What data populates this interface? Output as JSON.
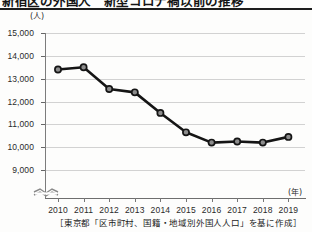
{
  "title": "新宿区の外国人　新型コロナ禍以前の推移",
  "caption": "［東京都「区市町村、国籍・地域別外国人人口」を基に作成］",
  "axis_break_icon": "axis-break-zigzag-icon",
  "chart_data": {
    "type": "line",
    "title": "新宿区の外国人　新型コロナ禍以前の推移",
    "xlabel": "(年)",
    "ylabel": "(人)",
    "categories": [
      "2010",
      "2011",
      "2012",
      "2013",
      "2014",
      "2015",
      "2016",
      "2017",
      "2018",
      "2019"
    ],
    "values": [
      13400,
      13500,
      12550,
      12400,
      11500,
      10650,
      10200,
      10250,
      10200,
      10450
    ],
    "ylim": [
      9000,
      15000
    ],
    "yticks": [
      "15,000",
      "14,000",
      "13,000",
      "12,000",
      "11,000",
      "10,000",
      "9,000"
    ],
    "ytick_values": [
      15000,
      14000,
      13000,
      12000,
      11000,
      10000,
      9000
    ],
    "grid": true,
    "legend": "none",
    "y_axis_broken_below": 9000,
    "marker": "circle",
    "line_color": "#151515",
    "marker_fill": "#8c8c8c",
    "grid_color": "#d2d2d2"
  }
}
